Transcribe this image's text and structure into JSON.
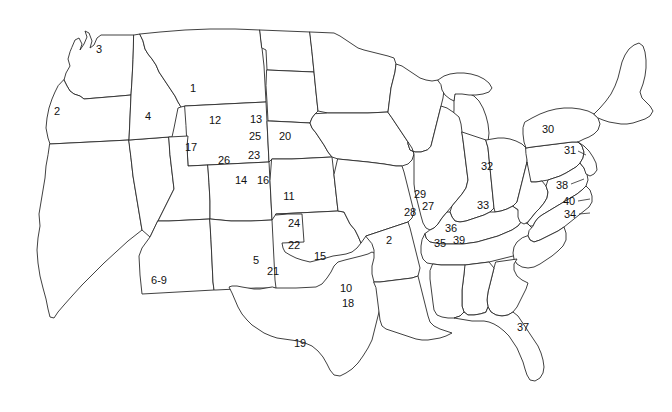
{
  "figure": {
    "kind": "outline-map",
    "region": "contiguous-united-states",
    "width": 672,
    "height": 412,
    "background_color": "#ffffff",
    "outline_color": "#2b2b2b",
    "label_color": "#111111",
    "label_font_size_px": 11,
    "label_count": 40
  },
  "labels": [
    {
      "id": "label-1",
      "text": "1",
      "x": 193,
      "y": 88,
      "state": "Montana"
    },
    {
      "id": "label-2",
      "text": "2",
      "x": 57,
      "y": 111,
      "state": "Oregon"
    },
    {
      "id": "label-3",
      "text": "3",
      "x": 99,
      "y": 49,
      "state": "Washington"
    },
    {
      "id": "label-4",
      "text": "4",
      "x": 148,
      "y": 116,
      "state": "Idaho"
    },
    {
      "id": "label-12",
      "text": "12",
      "x": 215,
      "y": 120,
      "state": "Wyoming"
    },
    {
      "id": "label-13",
      "text": "13",
      "x": 256,
      "y": 119,
      "state": "South Dakota (west)"
    },
    {
      "id": "label-25",
      "text": "25",
      "x": 255,
      "y": 136,
      "state": "South Dakota"
    },
    {
      "id": "label-20",
      "text": "20",
      "x": 285,
      "y": 136,
      "state": "South Dakota (east)"
    },
    {
      "id": "label-17",
      "text": "17",
      "x": 191,
      "y": 147,
      "state": "Utah (north)"
    },
    {
      "id": "label-23",
      "text": "23",
      "x": 254,
      "y": 155,
      "state": "Nebraska (west)"
    },
    {
      "id": "label-26",
      "text": "26",
      "x": 224,
      "y": 160,
      "state": "Utah / Colorado"
    },
    {
      "id": "label-14",
      "text": "14",
      "x": 241,
      "y": 180,
      "state": "Colorado (north)"
    },
    {
      "id": "label-16",
      "text": "16",
      "x": 263,
      "y": 180,
      "state": "Colorado (northeast)"
    },
    {
      "id": "label-11",
      "text": "11",
      "x": 289,
      "y": 196,
      "state": "Kansas (north)"
    },
    {
      "id": "label-24",
      "text": "24",
      "x": 294,
      "y": 223,
      "state": "Kansas (south)"
    },
    {
      "id": "label-22",
      "text": "22",
      "x": 294,
      "y": 245,
      "state": "Oklahoma (panhandle)"
    },
    {
      "id": "label-15",
      "text": "15",
      "x": 320,
      "y": 256,
      "state": "Oklahoma"
    },
    {
      "id": "label-5",
      "text": "5",
      "x": 256,
      "y": 260,
      "state": "New Mexico"
    },
    {
      "id": "label-21",
      "text": "21",
      "x": 273,
      "y": 271,
      "state": "New Mexico (east)"
    },
    {
      "id": "label-6-9",
      "text": "6-9",
      "x": 159,
      "y": 280,
      "state": "Arizona"
    },
    {
      "id": "label-10",
      "text": "10",
      "x": 346,
      "y": 288,
      "state": "Texas (northeast)"
    },
    {
      "id": "label-18",
      "text": "18",
      "x": 348,
      "y": 303,
      "state": "Texas (east)"
    },
    {
      "id": "label-19",
      "text": "19",
      "x": 300,
      "y": 343,
      "state": "Texas"
    },
    {
      "id": "label-29",
      "text": "29",
      "x": 420,
      "y": 194,
      "state": "Iowa"
    },
    {
      "id": "label-27",
      "text": "27",
      "x": 428,
      "y": 206,
      "state": "Illinois (west)"
    },
    {
      "id": "label-28",
      "text": "28",
      "x": 410,
      "y": 212,
      "state": "Missouri (northeast)"
    },
    {
      "id": "label-33",
      "text": "33",
      "x": 483,
      "y": 205,
      "state": "Indiana"
    },
    {
      "id": "label-32",
      "text": "32",
      "x": 487,
      "y": 166,
      "state": "Ohio"
    },
    {
      "id": "label-30",
      "text": "30",
      "x": 548,
      "y": 129,
      "state": "New York"
    },
    {
      "id": "label-31",
      "text": "31",
      "x": 570,
      "y": 150,
      "state": "Pennsylvania"
    },
    {
      "id": "label-36",
      "text": "36",
      "x": 451,
      "y": 228,
      "state": "Kentucky (west)"
    },
    {
      "id": "label-2b",
      "text": "2",
      "x": 389,
      "y": 240,
      "state": "Arkansas / Missouri"
    },
    {
      "id": "label-35",
      "text": "35",
      "x": 440,
      "y": 243,
      "state": "Tennessee (west)"
    },
    {
      "id": "label-39",
      "text": "39",
      "x": 459,
      "y": 240,
      "state": "Tennessee"
    },
    {
      "id": "label-38",
      "text": "38",
      "x": 562,
      "y": 185,
      "state": "Maryland / Delaware"
    },
    {
      "id": "label-40",
      "text": "40",
      "x": 569,
      "y": 201,
      "state": "Virginia"
    },
    {
      "id": "label-34",
      "text": "34",
      "x": 570,
      "y": 214,
      "state": "North Carolina"
    },
    {
      "id": "label-37",
      "text": "37",
      "x": 523,
      "y": 327,
      "state": "Florida"
    }
  ],
  "leader_lines": [
    {
      "id": "leader-38",
      "from_x": 571,
      "from_y": 184,
      "to_x": 583,
      "to_y": 179
    },
    {
      "id": "leader-40",
      "from_x": 578,
      "from_y": 201,
      "to_x": 590,
      "to_y": 199
    },
    {
      "id": "leader-34",
      "from_x": 579,
      "from_y": 214,
      "to_x": 590,
      "to_y": 213
    },
    {
      "id": "leader-31",
      "from_x": 578,
      "from_y": 151,
      "to_x": 586,
      "to_y": 155
    }
  ]
}
